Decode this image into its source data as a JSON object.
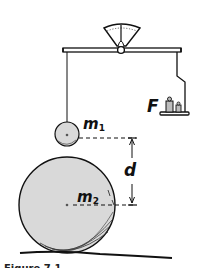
{
  "diagram": {
    "labels": {
      "small_mass": "m",
      "small_mass_sub": "1",
      "large_mass": "m",
      "large_mass_sub": "2",
      "distance": "d",
      "force": "F"
    },
    "caption_partial": "Figure 7.1",
    "colors": {
      "ink": "#111111",
      "sphere_fill": "#d9d9d9",
      "weight_fill": "#bdbdbd",
      "dial_fill": "#ffffff",
      "background": "#ffffff"
    },
    "components": [
      "scale-dial",
      "balance-beam",
      "pivot",
      "suspension-string",
      "small-sphere-m1",
      "pan-hanger",
      "weight-pan",
      "weights",
      "large-sphere-m2",
      "distance-marker-d",
      "ground"
    ]
  }
}
